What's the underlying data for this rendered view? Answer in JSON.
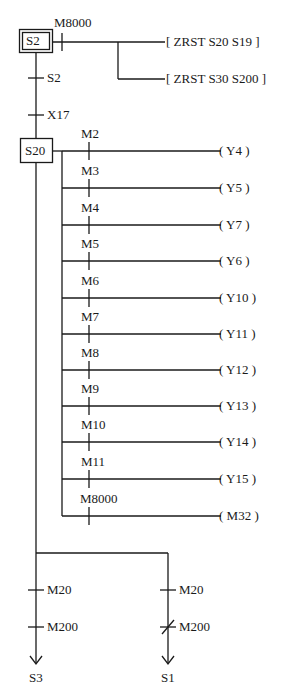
{
  "diagram": {
    "type": "SFC / ladder program",
    "initial_step": {
      "label": "S2",
      "double_box": true
    },
    "init_rung": {
      "contact": "M8000",
      "outputs": [
        "[ ZRST S20 S19 ]",
        "[ ZRST S30 S200 ]"
      ]
    },
    "transitions_top": [
      {
        "label": "S2"
      },
      {
        "label": "X17"
      }
    ],
    "step": {
      "label": "S20"
    },
    "rungs": [
      {
        "contact": "M2",
        "coil": "( Y4 )"
      },
      {
        "contact": "M3",
        "coil": "( Y5 )"
      },
      {
        "contact": "M4",
        "coil": "( Y7 )"
      },
      {
        "contact": "M5",
        "coil": "( Y6 )"
      },
      {
        "contact": "M6",
        "coil": "( Y10 )"
      },
      {
        "contact": "M7",
        "coil": "( Y11 )"
      },
      {
        "contact": "M8",
        "coil": "( Y12 )"
      },
      {
        "contact": "M9",
        "coil": "( Y13 )"
      },
      {
        "contact": "M10",
        "coil": "( Y14 )"
      },
      {
        "contact": "M11",
        "coil": "( Y15 )"
      },
      {
        "contact": "M8000",
        "coil": "( M32 )"
      }
    ],
    "branches": [
      {
        "transitions": [
          {
            "label": "M20",
            "negated": false
          },
          {
            "label": "M200",
            "negated": false
          }
        ],
        "target": "S3"
      },
      {
        "transitions": [
          {
            "label": "M20",
            "negated": false
          },
          {
            "label": "M200",
            "negated": true
          }
        ],
        "target": "S1"
      }
    ],
    "colors": {
      "line": "#1a1a1a",
      "background": "#ffffff"
    }
  }
}
